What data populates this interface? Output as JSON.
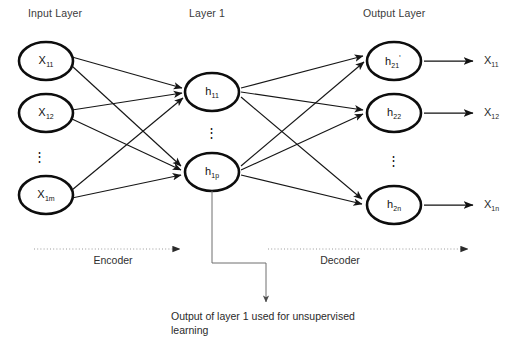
{
  "diagram": {
    "title_row": {
      "input_layer": "Input Layer",
      "hidden_layer": "Layer 1",
      "output_layer": "Output Layer"
    },
    "layers": {
      "input": {
        "name": "Input Layer",
        "nodes": [
          {
            "base": "X",
            "sub": "11"
          },
          {
            "base": "X",
            "sub": "12"
          },
          {
            "base": "X",
            "sub": "1m"
          }
        ],
        "ellipsis": "⋮"
      },
      "hidden": {
        "name": "Layer 1",
        "nodes": [
          {
            "base": "h",
            "sub": "11"
          },
          {
            "base": "h",
            "sub": "1p"
          }
        ],
        "ellipsis": "⋮"
      },
      "output": {
        "name": "Output Layer",
        "nodes": [
          {
            "base": "h",
            "sub": "21",
            "prime": "'"
          },
          {
            "base": "h",
            "sub": "22",
            "prime": ""
          },
          {
            "base": "h",
            "sub": "2n",
            "prime": ""
          }
        ],
        "ellipsis": "⋮"
      }
    },
    "outputs": [
      {
        "base": "X",
        "sub": "11"
      },
      {
        "base": "X",
        "sub": "12"
      },
      {
        "base": "X",
        "sub": "1n"
      }
    ],
    "flow": {
      "encoder_label": "Encoder",
      "decoder_label": "Decoder"
    },
    "callout": {
      "text": "Output of layer 1 used for unsupervised learning"
    },
    "colors": {
      "node_stroke": "#0d0d0d",
      "node_fill": "#ffffff",
      "edge": "#161616",
      "flow_line": "#9a9a9a",
      "flow_arrow": "#2a2a2a",
      "callout_line": "#6e6e6e",
      "text": "#1a1a1a",
      "background": "#ffffff"
    }
  }
}
